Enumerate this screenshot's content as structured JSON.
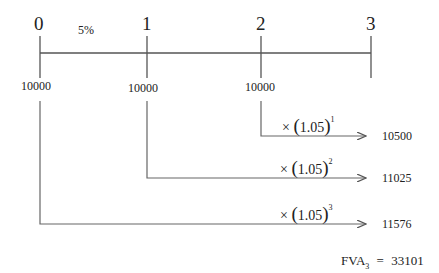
{
  "timeline": {
    "periods": [
      "0",
      "1",
      "2",
      "3"
    ],
    "rate_label": "5%",
    "payments": [
      "10000",
      "10000",
      "10000"
    ]
  },
  "compounding": [
    {
      "from_period": "2",
      "mult": "×",
      "base": "1.05",
      "exponent": "1",
      "result": "10500"
    },
    {
      "from_period": "1",
      "mult": "×",
      "base": "1.05",
      "exponent": "2",
      "result": "11025"
    },
    {
      "from_period": "0",
      "mult": "×",
      "base": "1.05",
      "exponent": "3",
      "result": "11576"
    }
  ],
  "total": {
    "label": "FVA",
    "subscript": "3",
    "equals": "=",
    "value": "33101"
  },
  "colors": {
    "line": "#555555",
    "text": "#222222"
  }
}
